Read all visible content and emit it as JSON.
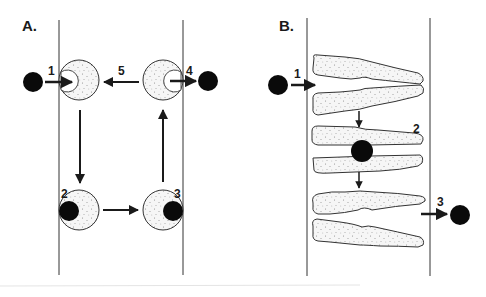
{
  "panels": {
    "a": {
      "label": "A.",
      "steps": [
        "1",
        "2",
        "3",
        "4",
        "5"
      ]
    },
    "b": {
      "label": "B.",
      "steps": [
        "1",
        "2",
        "3"
      ]
    }
  },
  "colors": {
    "ink": "#1a1a1a",
    "fill": "#f4f4f4",
    "stipple": "#8a8a8a",
    "ball": "#0a0a0a"
  }
}
